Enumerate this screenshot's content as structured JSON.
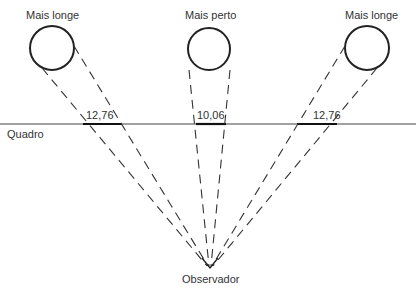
{
  "diagram": {
    "labels": {
      "left_object": "Mais longe",
      "center_object": "Mais perto",
      "right_object": "Mais longe",
      "picture_plane": "Quadro",
      "observer": "Observador"
    },
    "measurements": {
      "left": "12,76",
      "center": "10,06",
      "right": "12,76"
    },
    "colors": {
      "stroke": "#222222",
      "text": "#333333",
      "background": "#ffffff"
    }
  }
}
